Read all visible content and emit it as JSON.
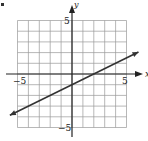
{
  "chart_data": {
    "type": "line",
    "title": "",
    "xlabel": "x",
    "ylabel": "y",
    "xlim": [
      -5,
      5
    ],
    "ylim": [
      -5,
      5
    ],
    "grid": true,
    "tick_labels": {
      "x_neg": "−5",
      "x_pos": "5",
      "y_pos": "5",
      "y_neg": "−5"
    },
    "series": [
      {
        "name": "line",
        "equation": "y = 0.5x - 1",
        "slope": 0.5,
        "intercept": -1,
        "x": [
          -5.7,
          6.1
        ],
        "y": [
          -3.85,
          2.05
        ],
        "arrows": "both",
        "color": "#333333"
      }
    ]
  },
  "colors": {
    "grid": "#9a9a9a",
    "axis": "#222222",
    "line": "#333333"
  }
}
